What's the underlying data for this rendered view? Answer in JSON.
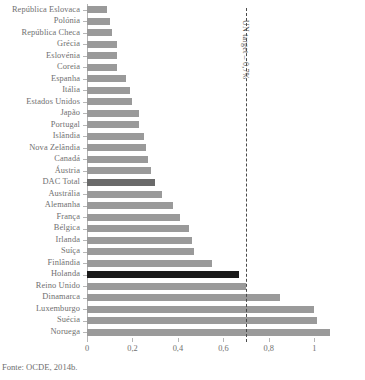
{
  "chart_data": {
    "type": "bar",
    "orientation": "horizontal",
    "title": "",
    "xlabel": "",
    "ylabel": "",
    "xlim": [
      0,
      1.1
    ],
    "grid": false,
    "legend": null,
    "xticks": [
      "0",
      "0,2",
      "0,4",
      "0,6",
      "0,8",
      "1"
    ],
    "xtick_values": [
      0,
      0.2,
      0.4,
      0.6,
      0.8,
      1
    ],
    "categories": [
      "República Eslovaca",
      "Polónia",
      "República Checa",
      "Grécia",
      "Eslovénia",
      "Coreia",
      "Espanha",
      "Itália",
      "Estados Unidos",
      "Japão",
      "Portugal",
      "Islândia",
      "Nova Zelândia",
      "Canadá",
      "Áustria",
      "DAC Total",
      "Austrália",
      "Alemanha",
      "França",
      "Bélgica",
      "Irlanda",
      "Suíça",
      "Finlândia",
      "Holanda",
      "Reino Unido",
      "Dinamarca",
      "Luxemburgo",
      "Suécia",
      "Noruega"
    ],
    "values": [
      0.09,
      0.1,
      0.11,
      0.13,
      0.13,
      0.13,
      0.17,
      0.19,
      0.2,
      0.23,
      0.23,
      0.25,
      0.26,
      0.27,
      0.28,
      0.3,
      0.33,
      0.38,
      0.41,
      0.45,
      0.46,
      0.47,
      0.55,
      0.67,
      0.7,
      0.85,
      1.0,
      1.01,
      1.07
    ],
    "bar_styles": [
      "normal",
      "normal",
      "normal",
      "normal",
      "normal",
      "normal",
      "normal",
      "normal",
      "normal",
      "normal",
      "normal",
      "normal",
      "normal",
      "normal",
      "normal",
      "dac",
      "normal",
      "normal",
      "normal",
      "normal",
      "normal",
      "normal",
      "normal",
      "highlight",
      "normal",
      "normal",
      "normal",
      "normal",
      "normal"
    ],
    "annotation": {
      "label": "UN target – 0,7%",
      "value": 0.7,
      "style": "dashed-vertical-line"
    },
    "colors": {
      "bar": "#9a9a9a",
      "bar_dac": "#6a6a6a",
      "bar_highlight": "#1a1a1a",
      "axis": "#b6b6b6",
      "text": "#6e6e6e",
      "target_line": "#4a4a4a"
    }
  },
  "source_note": "Fonte: OCDE, 2014b."
}
